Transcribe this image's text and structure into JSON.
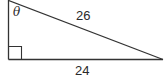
{
  "diagram": {
    "type": "right-triangle",
    "labels": {
      "angle": "θ",
      "hypotenuse": "26",
      "base": "24"
    },
    "right_angle_marker": true,
    "line_color": "#333333"
  }
}
